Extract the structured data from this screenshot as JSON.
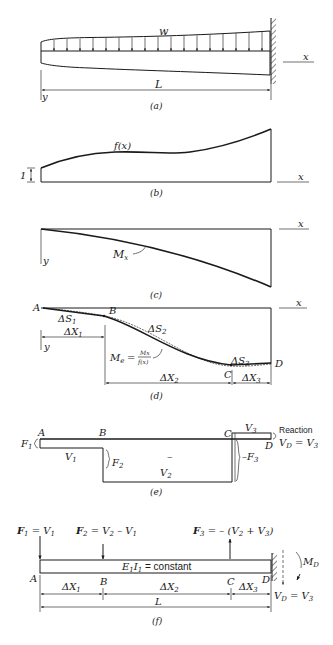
{
  "figure": {
    "a": {
      "caption": "(a)",
      "load_label": "w",
      "length_label": "L",
      "x_axis": "x",
      "y_axis": "y"
    },
    "b": {
      "caption": "(b)",
      "curve_label": "f(x)",
      "unit_label": "1",
      "x_axis": "x"
    },
    "c": {
      "caption": "(c)",
      "curve_label_main": "M",
      "curve_label_sub": "x",
      "x_axis": "x",
      "y_axis": "y"
    },
    "d": {
      "caption": "(d)",
      "x_axis": "x",
      "y_axis": "y",
      "points": [
        "A",
        "B",
        "C",
        "D"
      ],
      "arc_labels": [
        {
          "main": "ΔS",
          "sub": "1"
        },
        {
          "main": "ΔS",
          "sub": "2"
        },
        {
          "main": "ΔS",
          "sub": "3"
        }
      ],
      "segment_labels": [
        {
          "main": "ΔX",
          "sub": "1"
        },
        {
          "main": "ΔX",
          "sub": "2"
        },
        {
          "main": "ΔX",
          "sub": "3"
        }
      ],
      "formula_lhs_main": "M",
      "formula_lhs_sub": "e",
      "formula_eq": "=",
      "formula_num": "Mx",
      "formula_den": "f(x)"
    },
    "e": {
      "caption": "(e)",
      "points": [
        "A",
        "B",
        "C",
        "D"
      ],
      "labels": {
        "F1": "F",
        "F1_sub": "1",
        "V1": "V",
        "V1_sub": "1",
        "F2": "F",
        "F2_sub": "2",
        "minus": "–",
        "V2": "V",
        "V2_sub": "2",
        "negF3": "–F",
        "negF3_sub": "3",
        "V3": "V",
        "V3_sub": "3",
        "reaction": "Reaction",
        "VD": "V",
        "VD_sub": "D",
        "VD_eq": " = V",
        "VD_eq_sub": "3"
      }
    },
    "f": {
      "caption": "(f)",
      "points": [
        "A",
        "B",
        "C",
        "D"
      ],
      "forces": [
        {
          "main": "F",
          "sub": "1",
          "rest": " = V",
          "rest_sub": "1"
        },
        {
          "main": "F",
          "sub": "2",
          "rest": " = V",
          "rest_sub": "2",
          "tail": " – V",
          "tail_sub": "1"
        },
        {
          "main": "F",
          "sub": "3",
          "rest": " = – (V",
          "rest_sub": "2",
          "tail": " + V",
          "tail_sub": "3",
          "close": ")"
        }
      ],
      "beam_label": {
        "e": "E",
        "e_sub": "1",
        "i": "I",
        "i_sub": "1",
        "text": " = constant"
      },
      "segment_labels": [
        {
          "main": "ΔX",
          "sub": "1"
        },
        {
          "main": "ΔX",
          "sub": "2"
        },
        {
          "main": "ΔX",
          "sub": "3"
        }
      ],
      "length_label": "L",
      "moment_label": {
        "main": "M",
        "sub": "D"
      },
      "reaction_label": {
        "main": "V",
        "sub": "D",
        "rest": " = V",
        "rest_sub": "3"
      }
    }
  }
}
